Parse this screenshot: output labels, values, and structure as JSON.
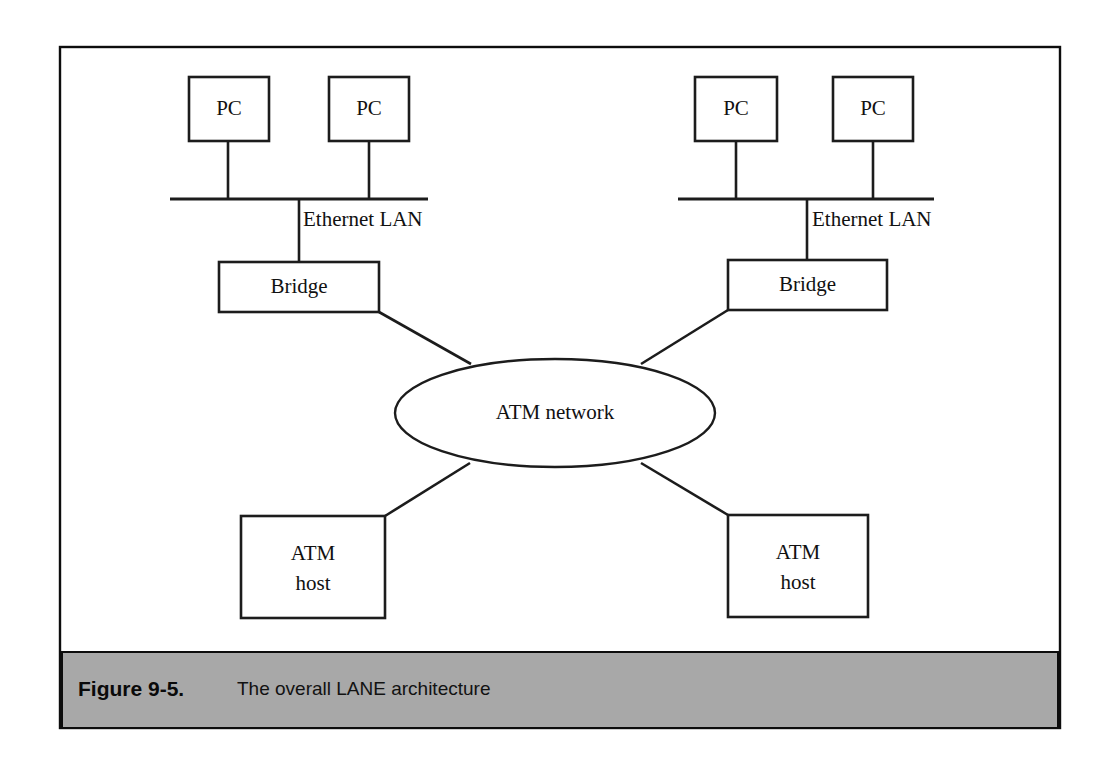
{
  "figure": {
    "caption_number": "Figure 9-5.",
    "caption_title": "The overall LANE architecture",
    "frame_color": "#0d0d0d",
    "caption_band_color": "#a8a8a8",
    "line_color": "#1c1c1c",
    "background_color": "#ffffff"
  },
  "diagram": {
    "type": "network-topology",
    "nodes": [
      {
        "id": "pc-left-1",
        "label": "PC",
        "shape": "rect",
        "x": 189,
        "y": 77,
        "w": 80,
        "h": 64
      },
      {
        "id": "pc-left-2",
        "label": "PC",
        "shape": "rect",
        "x": 329,
        "y": 77,
        "w": 80,
        "h": 64
      },
      {
        "id": "pc-right-1",
        "label": "PC",
        "shape": "rect",
        "x": 695,
        "y": 77,
        "w": 82,
        "h": 64
      },
      {
        "id": "pc-right-2",
        "label": "PC",
        "shape": "rect",
        "x": 833,
        "y": 77,
        "w": 80,
        "h": 64
      },
      {
        "id": "bridge-left",
        "label": "Bridge",
        "shape": "rect",
        "x": 219,
        "y": 262,
        "w": 160,
        "h": 50
      },
      {
        "id": "bridge-right",
        "label": "Bridge",
        "shape": "rect",
        "x": 728,
        "y": 260,
        "w": 159,
        "h": 50
      },
      {
        "id": "atm-host-left",
        "label_line1": "ATM",
        "label_line2": "host",
        "shape": "rect",
        "x": 241,
        "y": 516,
        "w": 144,
        "h": 102
      },
      {
        "id": "atm-host-right",
        "label_line1": "ATM",
        "label_line2": "host",
        "shape": "rect",
        "x": 728,
        "y": 515,
        "w": 140,
        "h": 102
      }
    ],
    "cloud": {
      "id": "atm-network",
      "label": "ATM network",
      "shape": "ellipse",
      "cx": 555,
      "cy": 413,
      "rx": 160,
      "ry": 54
    },
    "buses": [
      {
        "id": "ethernet-lan-left",
        "label": "Ethernet LAN",
        "x1": 170,
        "x2": 428,
        "y": 199,
        "label_x": 303,
        "label_y": 221,
        "drops": [
          {
            "from": "pc-left-1",
            "x": 228,
            "y1": 141,
            "y2": 199
          },
          {
            "from": "pc-left-2",
            "x": 369,
            "y1": 141,
            "y2": 199
          },
          {
            "to": "bridge-left",
            "x": 299,
            "y1": 199,
            "y2": 262
          }
        ]
      },
      {
        "id": "ethernet-lan-right",
        "label": "Ethernet LAN",
        "x1": 678,
        "x2": 934,
        "y": 199,
        "label_x": 812,
        "label_y": 221,
        "drops": [
          {
            "from": "pc-right-1",
            "x": 736,
            "y1": 141,
            "y2": 199
          },
          {
            "from": "pc-right-2",
            "x": 873,
            "y1": 141,
            "y2": 199
          },
          {
            "to": "bridge-right",
            "x": 807,
            "y1": 199,
            "y2": 260
          }
        ]
      }
    ],
    "links": [
      {
        "id": "link-bridge-left-cloud",
        "from": "bridge-left",
        "to": "atm-network",
        "x1": 379,
        "y1": 312,
        "x2": 471,
        "y2": 364
      },
      {
        "id": "link-bridge-right-cloud",
        "from": "bridge-right",
        "to": "atm-network",
        "x1": 728,
        "y1": 310,
        "x2": 641,
        "y2": 364
      },
      {
        "id": "link-host-left-cloud",
        "from": "atm-host-left",
        "to": "atm-network",
        "x1": 385,
        "y1": 516,
        "x2": 470,
        "y2": 463
      },
      {
        "id": "link-host-right-cloud",
        "from": "atm-host-right",
        "to": "atm-network",
        "x1": 728,
        "y1": 515,
        "x2": 641,
        "y2": 463
      }
    ],
    "frame": {
      "x": 60,
      "y": 47,
      "w": 1000,
      "h": 681
    },
    "caption_band": {
      "x": 62,
      "y": 652,
      "w": 996,
      "h": 76
    },
    "caption_figno_x": 78,
    "caption_title_x": 237,
    "caption_text_y": 690
  }
}
